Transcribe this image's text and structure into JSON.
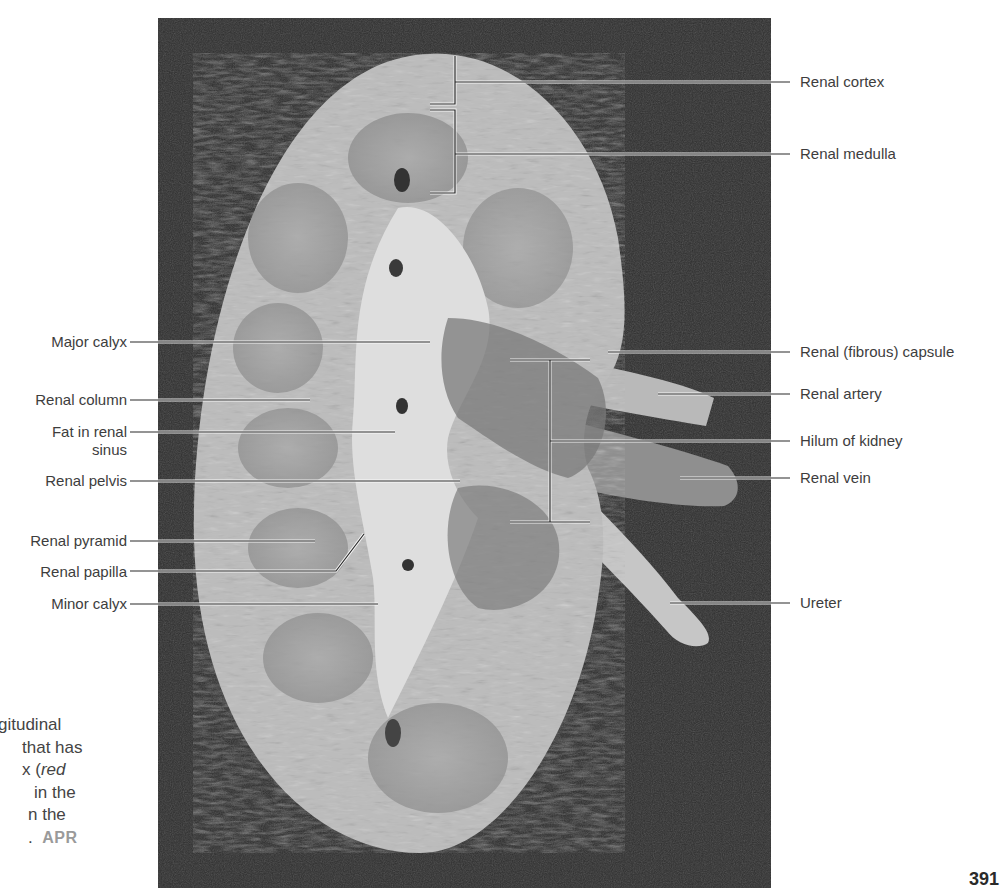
{
  "figure": {
    "labels_right": [
      {
        "id": "renal-cortex",
        "text": "Renal cortex",
        "y": 82
      },
      {
        "id": "renal-medulla",
        "text": "Renal medulla",
        "y": 154
      },
      {
        "id": "renal-fibrous-capsule",
        "text": "Renal (fibrous) capsule",
        "y": 352
      },
      {
        "id": "renal-artery",
        "text": "Renal artery",
        "y": 394
      },
      {
        "id": "hilum-of-kidney",
        "text": "Hilum of kidney",
        "y": 441
      },
      {
        "id": "renal-vein",
        "text": "Renal vein",
        "y": 478
      },
      {
        "id": "ureter",
        "text": "Ureter",
        "y": 603
      }
    ],
    "labels_left": [
      {
        "id": "major-calyx",
        "text": "Major calyx",
        "y": 342
      },
      {
        "id": "renal-column",
        "text": "Renal column",
        "y": 400
      },
      {
        "id": "fat-in-renal-sinus",
        "text": "Fat in renal",
        "text2": "sinus",
        "y": 432
      },
      {
        "id": "renal-pelvis",
        "text": "Renal pelvis",
        "y": 481
      },
      {
        "id": "renal-pyramid",
        "text": "Renal pyramid",
        "y": 541
      },
      {
        "id": "renal-papilla",
        "text": "Renal papilla",
        "y": 572
      },
      {
        "id": "minor-calyx",
        "text": "Minor calyx",
        "y": 604
      }
    ]
  },
  "caption": {
    "lines": [
      {
        "text": "gitudinal"
      },
      {
        "text": "that has"
      },
      {
        "pre": "x (",
        "italic": "red"
      },
      {
        "text": "in the"
      },
      {
        "text": "n the"
      },
      {
        "text": ".",
        "badge": "APR"
      }
    ]
  },
  "page_number": "391"
}
